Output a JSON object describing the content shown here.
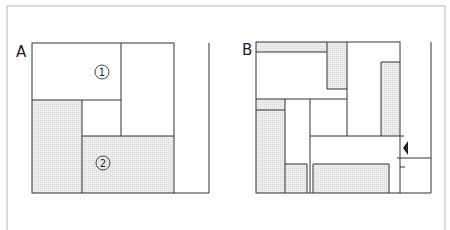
{
  "figure": {
    "frame_color": "#b5b5b5",
    "line_color": "#333333",
    "shade_color": "#e2e2e2",
    "panels": [
      {
        "id": "A",
        "label": "A",
        "markers": [
          {
            "id": "1",
            "text": "1"
          },
          {
            "id": "2",
            "text": "2"
          }
        ]
      },
      {
        "id": "B",
        "label": "B",
        "arrow": "left-pointing-triangle"
      }
    ]
  }
}
